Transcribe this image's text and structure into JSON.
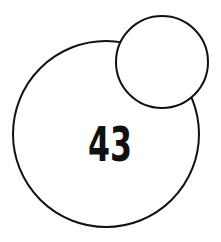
{
  "diagram": {
    "large_circle": {
      "label": "43",
      "cx": 106,
      "cy": 134,
      "r": 93
    },
    "small_circle": {
      "label": "",
      "cx": 162,
      "cy": 62,
      "r": 46
    },
    "stroke_color": "#111111",
    "fill_color": "#ffffff"
  }
}
